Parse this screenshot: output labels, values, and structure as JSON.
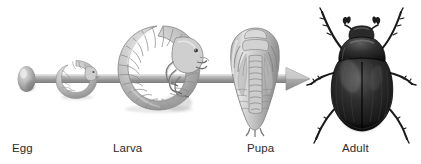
{
  "figure": {
    "background_color": "#ffffff",
    "width": 421,
    "height": 164,
    "arrow_color": "#a8a8a8",
    "label_color": "#2b2b2b"
  },
  "stages": [
    {
      "id": "egg",
      "label": "Egg",
      "illustration": "beetle-egg-oval",
      "description": "small grey oval egg"
    },
    {
      "id": "larva-early",
      "label": "",
      "illustration": "beetle-grub-small",
      "description": "small C-shaped white grub"
    },
    {
      "id": "larva",
      "label": "Larva",
      "illustration": "beetle-grub-large",
      "description": "large C-shaped segmented grub with legs and head capsule"
    },
    {
      "id": "pupa",
      "label": "Pupa",
      "illustration": "beetle-pupa",
      "description": "teardrop shaped pupa with developing appendages"
    },
    {
      "id": "adult",
      "label": "Adult",
      "illustration": "beetle-adult",
      "description": "dark adult scarab beetle, dorsal view with six legs and clubbed antennae"
    }
  ],
  "arrow": {
    "name": "metamorphosis-arrow",
    "direction": "left-to-right"
  }
}
